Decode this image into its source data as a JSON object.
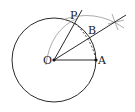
{
  "diagram": {
    "type": "geometric-construction",
    "stroke_color": "#2a2a2a",
    "thin_stroke_color": "#777777",
    "circle": {
      "center": "O",
      "cx": 54,
      "cy": 60,
      "r": 42
    },
    "points": [
      {
        "name": "O",
        "label": "O",
        "x": 54,
        "y": 60
      },
      {
        "name": "A",
        "label": "A",
        "x": 96,
        "y": 60
      },
      {
        "name": "P",
        "label": "P",
        "x": 75,
        "y": 23
      },
      {
        "name": "B",
        "label": "B",
        "x": 90,
        "y": 38
      }
    ],
    "segments": [
      {
        "from": "O",
        "to": "A",
        "style": "solid"
      },
      {
        "from": "O",
        "to": "P",
        "style": "solid"
      },
      {
        "from": "P",
        "to": "A",
        "style": "dashed"
      }
    ],
    "rays": [
      {
        "from": "O",
        "through": "B",
        "style": "solid"
      },
      {
        "from": "O",
        "through": "P",
        "style": "solid"
      }
    ],
    "construction_arcs": 3
  }
}
